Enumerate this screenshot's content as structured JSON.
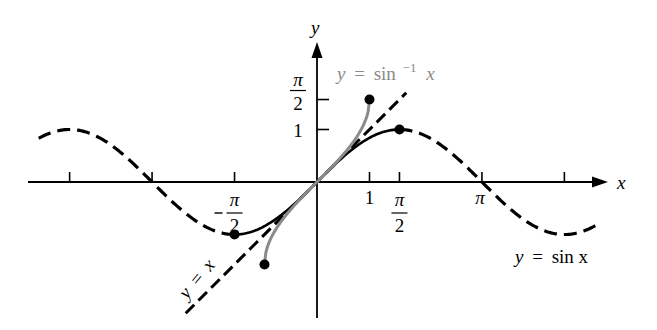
{
  "figure": {
    "axes": {
      "x_label": "x",
      "y_label": "y",
      "x_ticks": [
        {
          "value": -4.712,
          "label": ""
        },
        {
          "value": -3.1416,
          "label": ""
        },
        {
          "value": -1.5708,
          "label_num": "π",
          "label_den": "2",
          "negative": true
        },
        {
          "value": 1,
          "label": "1"
        },
        {
          "value": 1.5708,
          "label_num": "π",
          "label_den": "2",
          "negative": false
        },
        {
          "value": 3.1416,
          "label": "π"
        },
        {
          "value": 4.712,
          "label": ""
        }
      ],
      "y_ticks": [
        {
          "value": 1.5708,
          "label_num": "π",
          "label_den": "2"
        },
        {
          "value": 1,
          "label": "1"
        }
      ],
      "x_range": [
        -5.5,
        5.6
      ],
      "y_range": [
        -2.6,
        2.6
      ]
    },
    "curves": [
      {
        "id": "sin",
        "label_lhs": "y",
        "label_rhs": "sin x",
        "style": "dashed-black-with-solid-restricted",
        "color": "#000000",
        "domain": [
          -5.3,
          5.3
        ],
        "restricted_domain": [
          -1.5708,
          1.5708
        ]
      },
      {
        "id": "arcsin",
        "label_lhs": "y",
        "label_rhs": "sin",
        "label_sup": "−1",
        "label_var": "x",
        "style": "solid-gray",
        "color": "#888888",
        "domain": [
          -1,
          1
        ]
      },
      {
        "id": "identity",
        "label_lhs": "y",
        "label_rhs": "x",
        "style": "dashed-black",
        "color": "#000000",
        "domain": [
          -2.5,
          1.7
        ]
      }
    ],
    "points": [
      {
        "name": "sin-min-point",
        "x": -1.5708,
        "y": -1
      },
      {
        "name": "sin-max-point",
        "x": 1.5708,
        "y": 1
      },
      {
        "name": "arcsin-lower-endpoint",
        "x": -1,
        "y": -1.5708
      },
      {
        "name": "arcsin-upper-endpoint",
        "x": 1,
        "y": 1.5708
      }
    ],
    "equals_sign": "="
  }
}
